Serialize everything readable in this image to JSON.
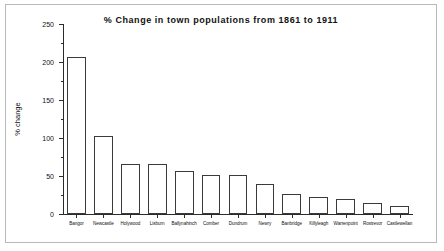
{
  "figure": {
    "border_color": "#b9b9b9",
    "background": "#ffffff"
  },
  "chart_data": {
    "type": "bar",
    "title": "% Change in town populations from 1861 to 1911",
    "xlabel": "",
    "ylabel": "% change",
    "ylim": [
      0,
      250
    ],
    "ytick_labels": [
      "0",
      "50",
      "100",
      "150",
      "200",
      "250"
    ],
    "ytick_values": [
      0,
      50,
      100,
      150,
      200,
      250
    ],
    "yminor_values": [
      25,
      75,
      125,
      175,
      225
    ],
    "grid": false,
    "legend": false,
    "bar_fill": "#ffffff",
    "bar_edge": "#3a3a3a",
    "categories": [
      "Bangor",
      "Newcastle",
      "Holywood",
      "Lisburn",
      "Ballynahinch",
      "Comber",
      "Dundrum",
      "Newry",
      "Banbridge",
      "Killyleagh",
      "Warrenpoint",
      "Rostrevor",
      "Castlewellan"
    ],
    "values": [
      207,
      102,
      66,
      66,
      56,
      51,
      51,
      39,
      26,
      22,
      20,
      15,
      11
    ]
  }
}
